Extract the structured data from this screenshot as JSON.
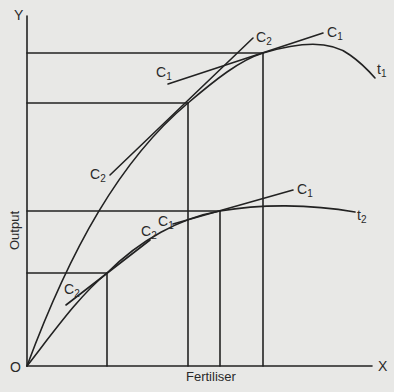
{
  "diagram": {
    "axes": {
      "y_label": "Y",
      "x_label": "X",
      "origin_label": "O",
      "y_title": "Output",
      "x_title": "Fertiliser"
    },
    "curves": [
      {
        "name": "t",
        "sub": "1"
      },
      {
        "name": "t",
        "sub": "2"
      }
    ],
    "tangent_labels": {
      "c1_t1_right": {
        "name": "C",
        "sub": "1"
      },
      "c1_t1_left": {
        "name": "C",
        "sub": "1"
      },
      "c2_t1_top": {
        "name": "C",
        "sub": "2"
      },
      "c2_t1_bottom": {
        "name": "C",
        "sub": "2"
      },
      "c1_t2_right": {
        "name": "C",
        "sub": "1"
      },
      "c1_t2_left": {
        "name": "C",
        "sub": "1"
      },
      "c2_t2_mid": {
        "name": "C",
        "sub": "2"
      },
      "c2_t2_low": {
        "name": "C",
        "sub": "2"
      }
    },
    "colors": {
      "background": "#e8e8e6",
      "ink": "#222222"
    }
  }
}
